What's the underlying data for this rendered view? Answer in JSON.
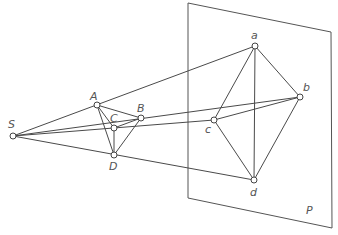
{
  "diagram": {
    "type": "perspective-projection",
    "plane": {
      "label": "P",
      "corners": [
        [
          188,
          3
        ],
        [
          331,
          32
        ],
        [
          332,
          228
        ],
        [
          188,
          198
        ]
      ],
      "label_pos": [
        306,
        214
      ]
    },
    "points": [
      {
        "id": "S",
        "label": "S",
        "x": 13,
        "y": 136,
        "lx": 8,
        "ly": 128
      },
      {
        "id": "A",
        "label": "A",
        "x": 97,
        "y": 105,
        "lx": 90,
        "ly": 100
      },
      {
        "id": "B",
        "label": "B",
        "x": 141,
        "y": 118,
        "lx": 137,
        "ly": 112
      },
      {
        "id": "C",
        "label": "C",
        "x": 114,
        "y": 128,
        "lx": 110,
        "ly": 122
      },
      {
        "id": "D",
        "label": "D",
        "x": 114,
        "y": 155,
        "lx": 109,
        "ly": 170
      },
      {
        "id": "a",
        "label": "a",
        "x": 255,
        "y": 46,
        "lx": 251,
        "ly": 39
      },
      {
        "id": "b",
        "label": "b",
        "x": 300,
        "y": 97,
        "lx": 303,
        "ly": 91
      },
      {
        "id": "c",
        "label": "c",
        "x": 214,
        "y": 120,
        "lx": 205,
        "ly": 133
      },
      {
        "id": "d",
        "label": "d",
        "x": 254,
        "y": 180,
        "lx": 250,
        "ly": 196
      }
    ],
    "edges": [
      [
        "S",
        "a"
      ],
      [
        "S",
        "b"
      ],
      [
        "S",
        "c"
      ],
      [
        "S",
        "d"
      ],
      [
        "A",
        "B"
      ],
      [
        "A",
        "C"
      ],
      [
        "A",
        "D"
      ],
      [
        "B",
        "C"
      ],
      [
        "B",
        "D"
      ],
      [
        "C",
        "D"
      ],
      [
        "a",
        "b"
      ],
      [
        "a",
        "c"
      ],
      [
        "a",
        "d"
      ],
      [
        "b",
        "c"
      ],
      [
        "b",
        "d"
      ],
      [
        "c",
        "d"
      ]
    ]
  }
}
